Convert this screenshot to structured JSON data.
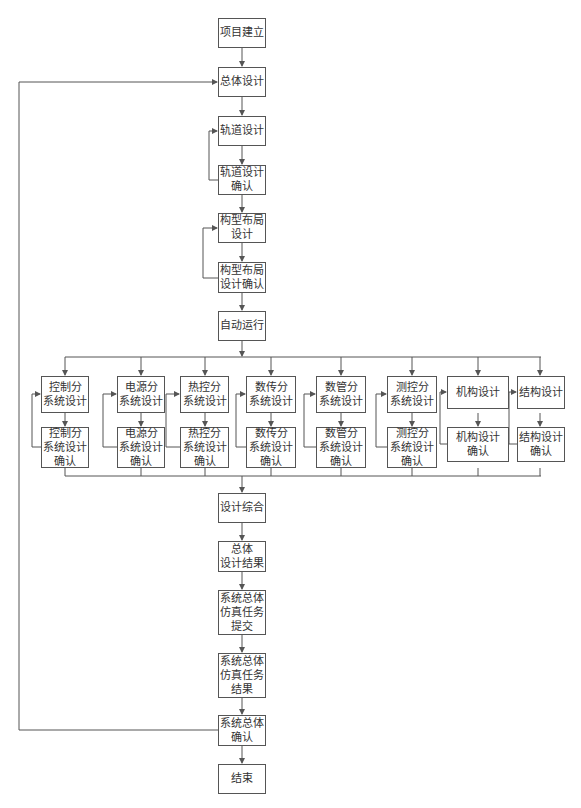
{
  "diagram": {
    "type": "flowchart",
    "main": {
      "project_setup": "项目建立",
      "overall_design": "总体设计",
      "orbit_design": "轨道设计",
      "orbit_confirm": "轨道设计\n确认",
      "config_design": "构型布局\n设计",
      "config_confirm": "构型布局\n设计确认",
      "auto_run": "自动运行",
      "design_integration": "设计综合",
      "overall_result": "总体\n设计结果",
      "sim_submit": "系统总体\n仿真任务\n提交",
      "sim_result": "系统总体\n仿真任务\n结果",
      "system_confirm": "系统总体\n确认",
      "end": "结束"
    },
    "subsystems": [
      {
        "design": "控制分\n系统设计",
        "confirm": "控制分\n系统设计\n确认"
      },
      {
        "design": "电源分\n系统设计",
        "confirm": "电源分\n系统设计\n确认"
      },
      {
        "design": "热控分\n系统设计",
        "confirm": "热控分\n系统设计\n确认"
      },
      {
        "design": "数传分\n系统设计",
        "confirm": "数传分\n系统设计\n确认"
      },
      {
        "design": "数管分\n系统设计",
        "confirm": "数管分\n系统设计\n确认"
      },
      {
        "design": "测控分\n系统设计",
        "confirm": "测控分\n系统设计\n确认"
      },
      {
        "design": "机构设计",
        "confirm": "机构设计\n确认"
      },
      {
        "design": "结构设计",
        "confirm": "结构设计\n确认"
      }
    ],
    "colors": {
      "line": "#555555",
      "box_border": "#555555",
      "text": "#333333",
      "background": "#ffffff"
    }
  }
}
